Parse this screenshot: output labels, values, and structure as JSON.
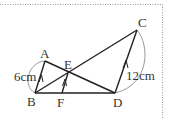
{
  "diagram": {
    "points": {
      "A": {
        "label": "A"
      },
      "B": {
        "label": "B"
      },
      "C": {
        "label": "C"
      },
      "D": {
        "label": "D"
      },
      "E": {
        "label": "E"
      },
      "F": {
        "label": "F"
      }
    },
    "measurements": {
      "AB": "6cm",
      "CD": "12cm"
    },
    "colors": {
      "line": "#222222",
      "arc": "#999999",
      "border": "#999999"
    }
  }
}
